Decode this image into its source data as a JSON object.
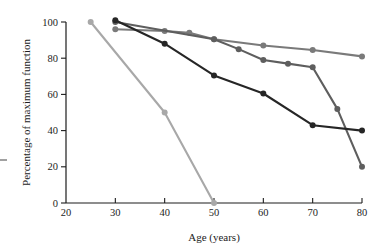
{
  "chart_data": {
    "type": "line",
    "title": "",
    "subtitle": "",
    "xlabel": "Age (years)",
    "ylabel": "Percentage of maximum function",
    "xlim": [
      20,
      80
    ],
    "ylim": [
      0,
      100
    ],
    "xticks": [
      20,
      30,
      40,
      50,
      60,
      70,
      80
    ],
    "xtick_labels": [
      "20",
      "30",
      "40",
      "50",
      "60",
      "70",
      "80"
    ],
    "yticks": [
      0,
      20,
      40,
      60,
      80,
      100
    ],
    "ytick_labels": [
      "0",
      "20",
      "40",
      "60",
      "80",
      "100"
    ],
    "grid": false,
    "legend": "none",
    "series": [
      {
        "name": "series-light-gray-steep",
        "color": "#a8a8a8",
        "marker": "circle",
        "x": [
          25,
          40,
          50
        ],
        "y": [
          100,
          50,
          0
        ]
      },
      {
        "name": "series-gray-top",
        "color": "#7a7a7a",
        "marker": "circle",
        "x": [
          30,
          40,
          45,
          50,
          60,
          70,
          80
        ],
        "y": [
          96,
          95,
          94,
          90.5,
          87,
          84.5,
          81
        ]
      },
      {
        "name": "series-medium-gray",
        "color": "#5e5e5e",
        "marker": "circle",
        "x": [
          30,
          50,
          55,
          60,
          65,
          70,
          75,
          80
        ],
        "y": [
          100,
          90.5,
          85,
          79,
          77,
          75,
          52,
          20
        ]
      },
      {
        "name": "series-black",
        "color": "#262626",
        "marker": "circle",
        "x": [
          30,
          40,
          50,
          60,
          70,
          80
        ],
        "y": [
          101,
          88,
          70.5,
          60.5,
          43,
          40
        ]
      }
    ]
  }
}
